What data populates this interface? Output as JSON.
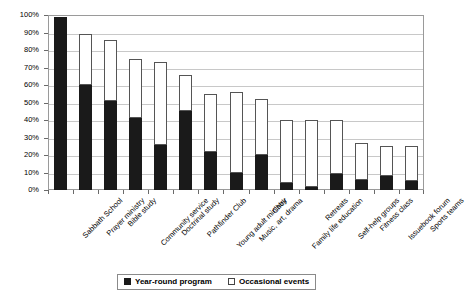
{
  "chart_data": {
    "type": "bar",
    "subtype": "stacked-vertical",
    "title": "",
    "subtitle": "",
    "xlabel": "",
    "ylabel": "",
    "ylim": [
      0,
      100
    ],
    "y_tick_labels": [
      "100%",
      "90%",
      "80%",
      "70%",
      "60%",
      "50%",
      "40%",
      "30%",
      "20%",
      "10%",
      "0%"
    ],
    "y_tick_values": [
      100,
      90,
      80,
      70,
      60,
      50,
      40,
      30,
      20,
      10,
      0
    ],
    "grid": true,
    "grid_axis": "y",
    "legend_position": "bottom",
    "categories": [
      "Sabbath School",
      "Prayer ministry",
      "Bible study",
      "Community service",
      "Doctrinal study",
      "Pathfinder Club",
      "Young adult ministry",
      "Music, art, drama",
      "Choir",
      "Family life education",
      "Retreats",
      "Self-help groups",
      "Fitness class",
      "Issuebook forum",
      "Sports teams"
    ],
    "series": [
      {
        "name": "Year-round program",
        "color": "#1a1a1a",
        "values": [
          99,
          60,
          51,
          41,
          26,
          45,
          22,
          10,
          20,
          4,
          2,
          9,
          6,
          8,
          5
        ]
      },
      {
        "name": "Occasional events",
        "color": "#ffffff",
        "values": [
          0,
          29,
          35,
          34,
          47,
          21,
          33,
          46,
          32,
          36,
          38,
          31,
          21,
          17,
          20
        ]
      }
    ],
    "totals": [
      99,
      89,
      86,
      75,
      73,
      66,
      55,
      56,
      52,
      40,
      40,
      40,
      27,
      25,
      25
    ]
  },
  "legend": {
    "items": [
      {
        "label": "Year-round program",
        "swatch": "filled-black-square"
      },
      {
        "label": "Occasional events",
        "swatch": "open-white-square"
      }
    ]
  }
}
